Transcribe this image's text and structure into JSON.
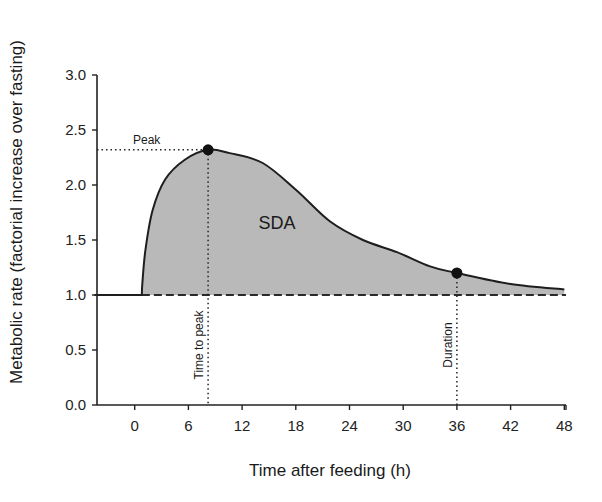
{
  "chart_data": {
    "type": "area",
    "title": "",
    "xlabel": "Time after feeding (h)",
    "ylabel": "Metabolic rate (factorial increase over fasting)",
    "xlim": [
      -4.5,
      48
    ],
    "ylim": [
      0,
      3.0
    ],
    "xticks": [
      0,
      6,
      12,
      18,
      24,
      30,
      36,
      42,
      48
    ],
    "yticks": [
      "0.0",
      "0.5",
      "1.0",
      "1.5",
      "2.0",
      "2.5",
      "3.0"
    ],
    "grid": false,
    "legend": null,
    "series": [
      {
        "name": "SDA response",
        "x": [
          -4.5,
          0.8,
          0.85,
          1.2,
          2.0,
          3.4,
          5.6,
          8.2,
          10.6,
          14.3,
          18.1,
          21.8,
          25.5,
          29.3,
          33.0,
          36.0,
          42.0,
          48.0
        ],
        "values": [
          1.0,
          1.0,
          1.1,
          1.41,
          1.77,
          2.05,
          2.23,
          2.32,
          2.29,
          2.2,
          1.95,
          1.67,
          1.5,
          1.39,
          1.26,
          1.2,
          1.1,
          1.05
        ]
      },
      {
        "name": "Fasting baseline (dashed)",
        "x": [
          -4.5,
          48
        ],
        "values": [
          1.0,
          1.0
        ]
      }
    ],
    "markers": [
      {
        "name": "Peak",
        "x": 8.2,
        "y": 2.32
      },
      {
        "name": "Duration",
        "x": 36,
        "y": 1.2
      }
    ],
    "annotations": [
      {
        "text": "Peak",
        "type": "horizontal-dotted",
        "y": 2.32
      },
      {
        "text": "Time to peak",
        "type": "vertical-dotted",
        "x": 8.2
      },
      {
        "text": "Duration",
        "type": "vertical-dotted",
        "x": 36
      },
      {
        "text": "SDA",
        "type": "area-label",
        "x": 15.8,
        "y": 1.66
      }
    ],
    "colors": {
      "fill": "#b8b8b8",
      "line": "#1e1e1e",
      "marker": "#111111"
    }
  },
  "labels": {
    "xlabel": "Time after feeding (h)",
    "ylabel": "Metabolic rate (factorial increase over fasting)",
    "peak": "Peak",
    "time_to_peak": "Time to peak",
    "duration": "Duration",
    "sda": "SDA"
  }
}
